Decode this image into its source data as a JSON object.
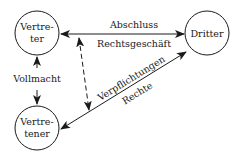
{
  "diagram": {
    "nodes": {
      "vertreter": {
        "line1": "Vertre-",
        "line2": "ter"
      },
      "dritter": {
        "label": "Dritter"
      },
      "vertretener": {
        "line1": "Vertre-",
        "line2": "tener"
      }
    },
    "edges": {
      "top": {
        "label_above": "Abschluss",
        "label_below": "Rechtsgeschäft"
      },
      "left": {
        "label": "Vollmacht"
      },
      "diagonal": {
        "label_above": "Verpflichtungen",
        "label_below": "Rechte"
      }
    },
    "colors": {
      "stroke": "#1a1a1a",
      "background": "#ffffff"
    }
  }
}
